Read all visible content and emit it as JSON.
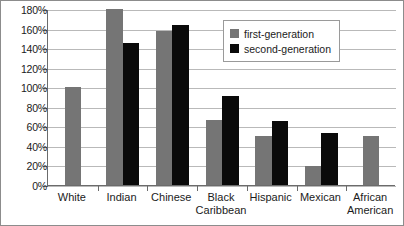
{
  "chart_data": {
    "type": "bar",
    "title": "",
    "xlabel": "",
    "ylabel": "",
    "ylim": [
      0,
      180
    ],
    "ytick_step": 20,
    "grid": true,
    "legend_position": "top-right",
    "categories": [
      "White",
      "Indian",
      "Chinese",
      "Black Caribbean",
      "Hispanic",
      "Mexican",
      "African American"
    ],
    "category_lines": [
      [
        "White"
      ],
      [
        "Indian"
      ],
      [
        "Chinese"
      ],
      [
        "Black",
        "Caribbean"
      ],
      [
        "Hispanic"
      ],
      [
        "Mexican"
      ],
      [
        "African",
        "American"
      ]
    ],
    "ytick_labels": [
      "0%",
      "20%",
      "40%",
      "60%",
      "80%",
      "100%",
      "120%",
      "140%",
      "160%",
      "180%"
    ],
    "ytick_values": [
      0,
      20,
      40,
      60,
      80,
      100,
      120,
      140,
      160,
      180
    ],
    "series": [
      {
        "name": "first-generation",
        "color": "#757575",
        "values": [
          100,
          182,
          158,
          66,
          50,
          19,
          50
        ]
      },
      {
        "name": "second-generation",
        "color": "#0a0a0a",
        "values": [
          null,
          145,
          164,
          91,
          65,
          53,
          null
        ]
      }
    ]
  },
  "legend": {
    "items": [
      {
        "label": "first-generation",
        "color": "#757575"
      },
      {
        "label": "second-generation",
        "color": "#0a0a0a"
      }
    ]
  },
  "colors": {
    "first_generation": "#757575",
    "second_generation": "#0a0a0a",
    "gridline": "#b9b9b9",
    "axis": "#6b6b6b",
    "border": "#8c8c8c",
    "text": "#1b1b1b",
    "background": "#ffffff"
  }
}
